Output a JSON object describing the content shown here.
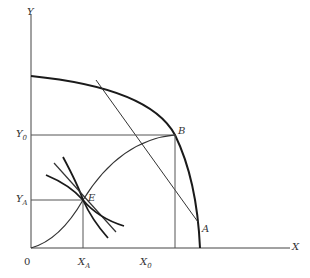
{
  "diagram": {
    "type": "production-possibility-frontier",
    "axes": {
      "x_label": "X",
      "y_label": "Y",
      "origin_label": "0"
    },
    "points": {
      "B": {
        "label": "B",
        "x_tick": "X",
        "x_tick_sub": "0",
        "y_tick": "Y",
        "y_tick_sub": "0"
      },
      "E": {
        "label": "E",
        "x_tick": "X",
        "x_tick_sub": "A",
        "y_tick": "Y",
        "y_tick_sub": "A"
      }
    },
    "tangent_label": "A",
    "colors": {
      "line": "#1a1a1a",
      "thin": "#333333",
      "background": "#ffffff"
    }
  }
}
